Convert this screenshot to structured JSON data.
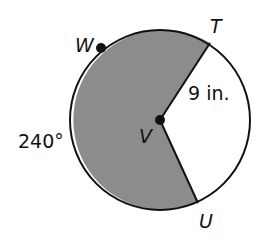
{
  "diagram": {
    "type": "circle-sector",
    "circle": {
      "cx": 160,
      "cy": 120,
      "r": 90
    },
    "center_point": {
      "label": "V",
      "x": 160,
      "y": 120
    },
    "points": [
      {
        "label": "T",
        "x": 210,
        "y": 43
      },
      {
        "label": "U",
        "x": 198,
        "y": 203
      },
      {
        "label": "W",
        "x": 101,
        "y": 48
      }
    ],
    "labels": {
      "W": "W",
      "T": "T",
      "U": "U",
      "V": "V",
      "radius": "9 in.",
      "arc": "240°"
    },
    "shaded_sector": {
      "from": "T",
      "to": "U",
      "via": "W",
      "measure_deg": 240
    },
    "colors": {
      "shade": "#8c8c8c",
      "stroke": "#111111",
      "background": "#ffffff"
    }
  }
}
